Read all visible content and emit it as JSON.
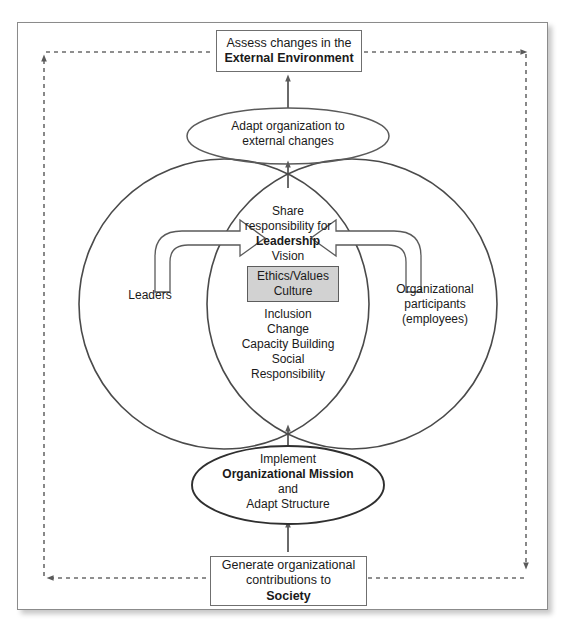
{
  "diagram": {
    "colors": {
      "outline": "#6f6f6f",
      "circle_outline": "#4a4a4a",
      "dashed_feedback": "#6b6b6b",
      "ethics_box_fill": "#d2d2d2",
      "text": "#1a1a1a",
      "page_background": "#ffffff"
    },
    "top_box": {
      "line1": "Assess changes in the",
      "line2": "External Environment"
    },
    "adapt_ellipse": {
      "line1": "Adapt organization to",
      "line2": "external changes"
    },
    "venn": {
      "left_circle_label": "Leaders",
      "right_circle_label_line1": "Organizational",
      "right_circle_label_line2": "participants",
      "right_circle_label_line3": "(employees)",
      "center_top": {
        "line1": "Share",
        "line2": "responsibility for",
        "line3": "Leadership",
        "line4": "Vision"
      },
      "ethics_box": {
        "line1": "Ethics/Values",
        "line2": "Culture"
      },
      "center_bottom": {
        "line1": "Inclusion",
        "line2": "Change",
        "line3": "Capacity Building",
        "line4": "Social",
        "line5": "Responsibility"
      }
    },
    "mission_ellipse": {
      "line1": "Implement",
      "line2": "Organizational Mission",
      "line3": "and",
      "line4": "Adapt Structure"
    },
    "bottom_box": {
      "line1": "Generate organizational",
      "line2": "contributions to",
      "line3": "Society"
    }
  }
}
